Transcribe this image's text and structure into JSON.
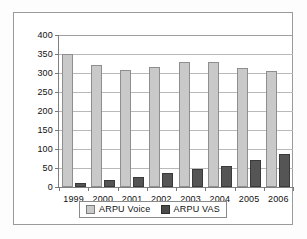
{
  "chart_data": {
    "type": "bar",
    "title": "",
    "xlabel": "",
    "ylabel": "",
    "categories": [
      "1999",
      "2000",
      "2001",
      "2002",
      "2003",
      "2004",
      "2005",
      "2006"
    ],
    "series": [
      {
        "name": "ARPU Voice",
        "color": "#c9c9c9",
        "values": [
          350,
          320,
          308,
          315,
          329,
          328,
          312,
          304
        ]
      },
      {
        "name": "ARPU VAS",
        "color": "#4a4a4a",
        "values": [
          10,
          18,
          27,
          38,
          47,
          55,
          70,
          86
        ]
      }
    ],
    "ylim": [
      0,
      400
    ],
    "ytick_step": 50,
    "yticks": [
      "0",
      "50",
      "100",
      "150",
      "200",
      "250",
      "300",
      "350",
      "400"
    ],
    "grid": true,
    "legend_position": "bottom"
  },
  "legend": {
    "items": [
      {
        "label": "ARPU Voice",
        "swatch": "legend-swatch-voice"
      },
      {
        "label": "ARPU VAS",
        "swatch": "legend-swatch-vas"
      }
    ]
  },
  "colors": {
    "voice": "#c9c9c9",
    "vas": "#4a4a4a",
    "gridline": "#b9b9b9",
    "axis": "#808080",
    "frame": "#9a9a9a"
  }
}
